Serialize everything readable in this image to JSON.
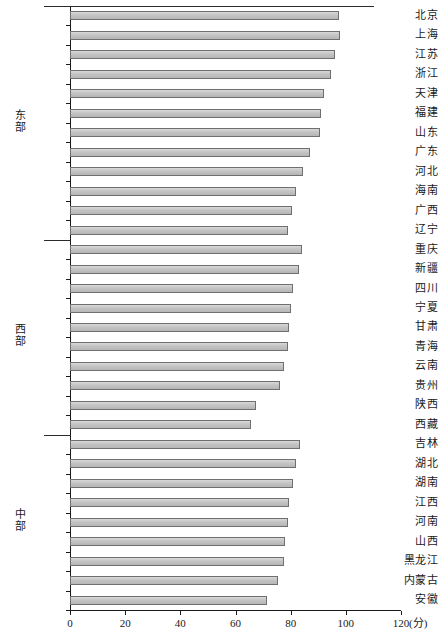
{
  "chart_data": {
    "type": "bar",
    "orientation": "horizontal",
    "title": "",
    "xlabel": "(分)",
    "ylabel": "",
    "xlim": [
      0,
      120
    ],
    "xticks": [
      0,
      20,
      40,
      60,
      80,
      100,
      120
    ],
    "xticklabels": [
      "0",
      "20",
      "40",
      "60",
      "80",
      "100",
      "120"
    ],
    "unit": "(分)",
    "grid": false,
    "legend": null,
    "groups": [
      {
        "name": "东部",
        "categories": [
          "北京",
          "上海",
          "江苏",
          "浙江",
          "天津",
          "福建",
          "山东",
          "广东",
          "河北",
          "海南",
          "广西",
          "辽宁"
        ],
        "values": [
          97.5,
          98.0,
          96.0,
          94.5,
          92.0,
          91.0,
          90.5,
          87.0,
          84.5,
          82.0,
          80.5,
          79.0
        ]
      },
      {
        "name": "西部",
        "categories": [
          "重庆",
          "新疆",
          "四川",
          "宁夏",
          "甘肃",
          "青海",
          "云南",
          "贵州",
          "陕西",
          "西藏"
        ],
        "values": [
          84.0,
          83.0,
          81.0,
          80.0,
          79.5,
          79.0,
          77.5,
          76.0,
          67.5,
          65.5
        ]
      },
      {
        "name": "中部",
        "categories": [
          "吉林",
          "湖北",
          "湖南",
          "江西",
          "河南",
          "山西",
          "黑龙江",
          "内蒙古",
          "安徽"
        ],
        "values": [
          83.5,
          82.0,
          81.0,
          79.5,
          79.0,
          78.0,
          77.5,
          75.5,
          71.5
        ]
      }
    ]
  },
  "axis": {
    "x_unit_label": "(分)"
  }
}
